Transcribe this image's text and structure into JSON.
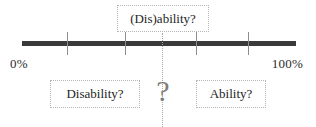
{
  "figure": {
    "title_label": "(Dis)ability?",
    "axis": {
      "start_label": "0%",
      "end_label": "100%",
      "line_color": "#3a3a3a",
      "tick_color": "#8d8d8d",
      "ticks": [
        {
          "label": "",
          "position_pct": 16
        },
        {
          "label": "",
          "position_pct": 37
        },
        {
          "label": "",
          "position_pct": 63
        },
        {
          "label": "",
          "position_pct": 82
        }
      ]
    },
    "pole_left_label": "Disability?",
    "pole_right_label": "Ability?",
    "center_marker": "?",
    "connector_color": "#a8a8a8",
    "box_border_color": "#b4b4b4",
    "text_color": "#1e1e1e"
  }
}
